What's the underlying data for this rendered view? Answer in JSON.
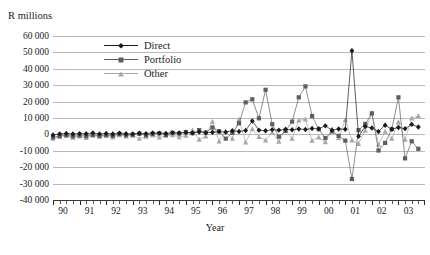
{
  "figure": {
    "cut_title": "",
    "y_axis_unit": "R millions",
    "x_axis_title": "Year"
  },
  "legend": {
    "position": "inside-top-left",
    "entries": [
      {
        "label": "Direct",
        "color": "#1a1a1a",
        "marker": "diamond"
      },
      {
        "label": "Portfolio",
        "color": "#5e5e5e",
        "marker": "square"
      },
      {
        "label": "Other",
        "color": "#a8a8a8",
        "marker": "triangle"
      }
    ]
  },
  "chart_data": {
    "type": "line",
    "title": "",
    "xlabel": "Year",
    "ylabel": "R millions",
    "ylim": [
      -40000,
      60000
    ],
    "ytick_step": 10000,
    "ytick_labels": [
      "60 000",
      "50 000",
      "40 000",
      "30 000",
      "20 000",
      "10 000",
      "0",
      "-10 000",
      "-20 000",
      "-30 000",
      "-40 000"
    ],
    "ytick_values": [
      60000,
      50000,
      40000,
      30000,
      20000,
      10000,
      0,
      -10000,
      -20000,
      -30000,
      -40000
    ],
    "grid": true,
    "x_tick_labels": [
      "90",
      "91",
      "92",
      "93",
      "94",
      "95",
      "96",
      "97",
      "98",
      "99",
      "00",
      "01",
      "02",
      "03"
    ],
    "x_minor_ticks_per_year": 4,
    "x_frequency": "quarterly",
    "x_start": 1990.0,
    "x_end": 2003.75,
    "x": [
      1990.0,
      1990.25,
      1990.5,
      1990.75,
      1991.0,
      1991.25,
      1991.5,
      1991.75,
      1992.0,
      1992.25,
      1992.5,
      1992.75,
      1993.0,
      1993.25,
      1993.5,
      1993.75,
      1994.0,
      1994.25,
      1994.5,
      1994.75,
      1995.0,
      1995.25,
      1995.5,
      1995.75,
      1996.0,
      1996.25,
      1996.5,
      1996.75,
      1997.0,
      1997.25,
      1997.5,
      1997.75,
      1998.0,
      1998.25,
      1998.5,
      1998.75,
      1999.0,
      1999.25,
      1999.5,
      1999.75,
      2000.0,
      2000.25,
      2000.5,
      2000.75,
      2001.0,
      2001.25,
      2001.5,
      2001.75,
      2002.0,
      2002.25,
      2002.5,
      2002.75,
      2003.0,
      2003.25,
      2003.5,
      2003.75
    ],
    "series": [
      {
        "name": "Direct",
        "color": "#1a1a1a",
        "marker": "diamond",
        "values": [
          -400,
          300,
          600,
          200,
          500,
          400,
          900,
          300,
          600,
          200,
          800,
          400,
          300,
          700,
          500,
          900,
          800,
          600,
          1100,
          900,
          1200,
          900,
          1500,
          1000,
          1300,
          1700,
          1400,
          2200,
          1800,
          2400,
          8200,
          2600,
          2200,
          2900,
          2600,
          3100,
          2800,
          3300,
          3000,
          3600,
          3400,
          5200,
          2600,
          3300,
          3100,
          51000,
          -1200,
          4800,
          3900,
          1800,
          5600,
          3200,
          4200,
          3500,
          6100,
          4500
        ]
      },
      {
        "name": "Portfolio",
        "color": "#5e5e5e",
        "marker": "square",
        "values": [
          -1800,
          -900,
          -400,
          -1200,
          -600,
          -1100,
          -300,
          -800,
          -400,
          -900,
          200,
          -500,
          -200,
          400,
          -600,
          300,
          600,
          -300,
          900,
          500,
          1400,
          700,
          2600,
          1100,
          4200,
          1900,
          -2600,
          900,
          6800,
          19500,
          21400,
          9800,
          27200,
          6200,
          -1400,
          2100,
          7800,
          22600,
          29300,
          11200,
          3100,
          -2200,
          1800,
          -900,
          -3800,
          -27200,
          2600,
          6400,
          12800,
          -9800,
          -5200,
          3100,
          22600,
          -14600,
          -4200,
          -8800
        ]
      },
      {
        "name": "Other",
        "color": "#a8a8a8",
        "marker": "triangle",
        "values": [
          -2600,
          -1400,
          -800,
          -1900,
          -1200,
          -2100,
          -700,
          -1500,
          -900,
          -1800,
          -400,
          -1100,
          -700,
          -2600,
          -1300,
          -600,
          -1800,
          -900,
          -400,
          -1600,
          -700,
          2600,
          -3100,
          -1200,
          7800,
          -4200,
          1800,
          -2600,
          9200,
          -4800,
          3200,
          -1400,
          -3600,
          1200,
          -4400,
          2800,
          -2600,
          8600,
          9200,
          -3800,
          -1800,
          -4600,
          3200,
          -2200,
          8900,
          -3600,
          -5800,
          2400,
          13200,
          -6200,
          1800,
          -2600,
          7600,
          -3100,
          9800,
          11400
        ]
      }
    ]
  }
}
